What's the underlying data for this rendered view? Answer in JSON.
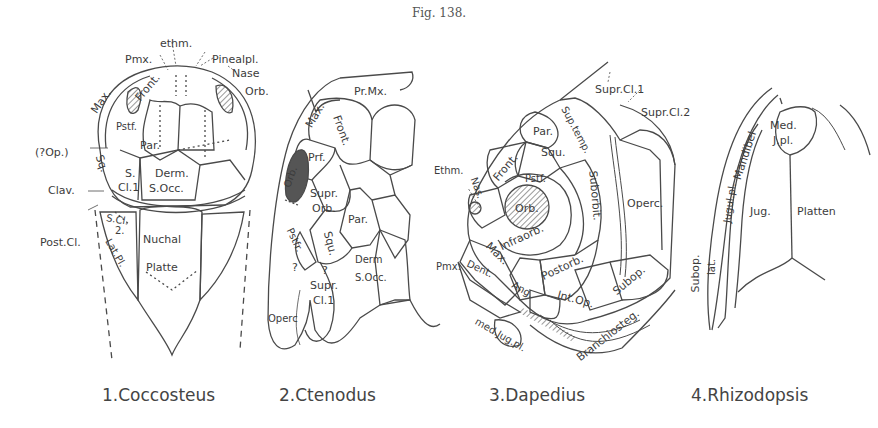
{
  "figure": {
    "title": "Fig. 138."
  },
  "panels": [
    {
      "caption": "1.Coccosteus",
      "labels": {
        "ethm": "ethm.",
        "pmx": "Pmx.",
        "pinealpl": "Pinealpl.",
        "nase": "Nase",
        "orb": "Orb.",
        "max": "Max.",
        "front": "Front.",
        "pstf": "Pstf.",
        "par": "Par.",
        "op": "(?Op.)",
        "squ": "Sq.",
        "s": "S.",
        "cl1": "Cl.1",
        "derm": "Derm.",
        "socc": "S.Occ.",
        "clav": "Clav.",
        "scl": "S.Cl.",
        "two": "2.",
        "postcl": "Post.Cl.",
        "latpl": "Lat.Pl.",
        "nuchal": "Nuchal",
        "platte": "Platte"
      }
    },
    {
      "caption": "2.Ctenodus",
      "labels": {
        "prmx": "Pr.Mx.",
        "max": "Max.",
        "front": "Front.",
        "prf": "Prf.",
        "orb": "Orb.",
        "supr": "Supr.",
        "orb2": "Orb.",
        "par": "Par.",
        "pstfr": "Pstfr.",
        "squ": "Squ.",
        "derm": "Derm",
        "socc": "S.Occ.",
        "q1": "?",
        "q2": "?",
        "supr2": "Supr.",
        "cl1": "Cl.1",
        "operc": "Operc"
      }
    },
    {
      "caption": "3.Dapedius",
      "labels": {
        "suprcl1": "Supr.Cl.1",
        "suprcl2": "Supr.Cl.2",
        "suptemp": "Sup.temp.",
        "par": "Par.",
        "squ": "Squ.",
        "front": "Front.",
        "ethm": "Ethm.",
        "nas": "Nas.",
        "pstf": "Pstf.",
        "orb": "Orb.",
        "suborbit": "Suborbit.",
        "operc": "Operc.",
        "infraorb": "Infraorb.",
        "max": "Max.",
        "postorb": "Postorb.",
        "pmx": "Pmx.",
        "dent": "Dent.",
        "ang": "Ang.",
        "intop": "Int.Op.",
        "subop": "Subop.",
        "medjugpl": "med.Jug.pl.",
        "branchiosteg": "Branchiosteg."
      }
    },
    {
      "caption": "4.Rhizodopsis",
      "labels": {
        "mandibel": "Mandibel",
        "med": "Med.",
        "jpl": "J.pl.",
        "jugulpl": "Jugul.pl.",
        "jug": "Jug.",
        "platten": "Platten",
        "subop": "Subop.",
        "lat": "lat."
      }
    }
  ],
  "colors": {
    "ink": "#3c3c3c",
    "background": "#ffffff"
  }
}
